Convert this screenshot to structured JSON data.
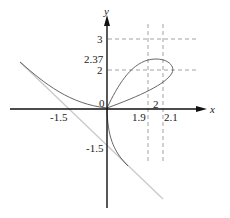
{
  "figure": {
    "axes": {
      "x_label": "x",
      "y_label": "y",
      "origin_label": "0"
    },
    "x_ticks": [
      "-1.5",
      "1.9",
      "2",
      "2.1"
    ],
    "y_ticks": [
      "3",
      "2.37",
      "2",
      "-1.5"
    ],
    "curve": "folium-like curve with loop in first quadrant and asymptote",
    "asymptote": "line x + y = -1.5 (light gray)",
    "dashed_guides": {
      "horizontal": [
        "y = 3",
        "y = 2"
      ],
      "vertical": [
        "x = 1.9",
        "x = 2.1"
      ]
    },
    "colors": {
      "axis": "#111111",
      "curve": "#555555",
      "asymptote": "#c8c8c8",
      "dashed": "#888888"
    }
  }
}
